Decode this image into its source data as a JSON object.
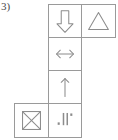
{
  "figure": {
    "label": "3)",
    "stroke_color": "#8c8c8c",
    "border_color": "#9a9a9a",
    "background_color": "#ffffff",
    "layout": "cross-shaped grid of 6 bordered cells",
    "cells": [
      {
        "id": "arrow-down",
        "icon": "block-arrow-down-icon",
        "description": "outlined block arrow pointing down",
        "row": 1,
        "column": 2
      },
      {
        "id": "triangle",
        "icon": "triangle-outline-icon",
        "description": "outlined upward triangle",
        "row": 1,
        "column": 3
      },
      {
        "id": "arrow-left-right",
        "icon": "double-headed-horizontal-arrow-icon",
        "description": "thin double headed horizontal arrow",
        "row": 2,
        "column": 2
      },
      {
        "id": "arrow-up",
        "icon": "arrow-up-icon",
        "description": "thin line arrow pointing up",
        "row": 3,
        "column": 2
      },
      {
        "id": "crossed-box",
        "icon": "crossed-square-icon",
        "description": "square with both diagonals drawn",
        "row": 4,
        "column": 1
      },
      {
        "id": "vertical-bars",
        "icon": "vertical-bars-icon",
        "description": "two tall vertical bars flanked by two small square dots",
        "row": 4,
        "column": 2
      }
    ]
  }
}
